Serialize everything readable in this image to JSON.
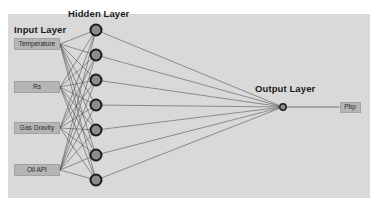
{
  "diagram": {
    "title_input": "Input Layer",
    "title_hidden": "Hidden Layer",
    "title_output": "Output Layer",
    "background_color": "#ffffff",
    "panel_color": "#d9d9d9",
    "node_fill": "#8c8c8c",
    "node_stroke": "#1c1c1c",
    "edge_color": "#4a4a4a",
    "box_fill": "#b5b5b5",
    "box_stroke": "#a2a2a2"
  },
  "input_layer": {
    "label": "Input Layer",
    "nodes": [
      {
        "label": "Temperature",
        "x": 37,
        "y": 44,
        "w": 46,
        "h": 12
      },
      {
        "label": "Rs",
        "x": 37,
        "y": 87,
        "w": 46,
        "h": 12
      },
      {
        "label": "Gas Gravity",
        "x": 37,
        "y": 128,
        "w": 46,
        "h": 12
      },
      {
        "label": "Oil API",
        "x": 37,
        "y": 170,
        "w": 46,
        "h": 12
      }
    ]
  },
  "hidden_layer": {
    "label": "Hidden Layer",
    "count": 7,
    "nodes": [
      {
        "id": "h1",
        "x": 96,
        "y": 30
      },
      {
        "id": "h2",
        "x": 96,
        "y": 55
      },
      {
        "id": "h3",
        "x": 96,
        "y": 80
      },
      {
        "id": "h4",
        "x": 96,
        "y": 105
      },
      {
        "id": "h5",
        "x": 96,
        "y": 130
      },
      {
        "id": "h6",
        "x": 96,
        "y": 155
      },
      {
        "id": "h7",
        "x": 96,
        "y": 180
      }
    ],
    "node_radius": 5.5
  },
  "output_layer": {
    "label": "Output Layer",
    "nodes": [
      {
        "id": "o1",
        "x": 283,
        "y": 107
      }
    ],
    "node_radius": 3.2,
    "outputs": [
      {
        "label": "Pbp",
        "x": 350,
        "y": 107,
        "w": 21,
        "h": 11
      }
    ]
  }
}
